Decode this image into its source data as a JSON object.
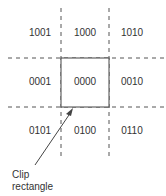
{
  "diagram": {
    "regions": [
      {
        "code": "1001",
        "x": 40,
        "y": 36
      },
      {
        "code": "1000",
        "x": 85,
        "y": 36
      },
      {
        "code": "1010",
        "x": 132,
        "y": 36
      },
      {
        "code": "0001",
        "x": 40,
        "y": 85
      },
      {
        "code": "0000",
        "x": 85,
        "y": 85
      },
      {
        "code": "0010",
        "x": 132,
        "y": 85
      },
      {
        "code": "0101",
        "x": 40,
        "y": 134
      },
      {
        "code": "0100",
        "x": 85,
        "y": 134
      },
      {
        "code": "0110",
        "x": 132,
        "y": 134
      }
    ],
    "annotation": {
      "line1": "Clip",
      "line2": "rectangle"
    },
    "colors": {
      "line": "#555555",
      "text": "#333333"
    }
  }
}
